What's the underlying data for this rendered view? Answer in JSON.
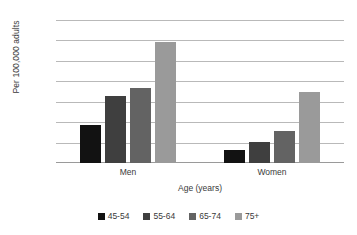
{
  "chart_data": {
    "type": "bar",
    "title": "",
    "xlabel": "Age (years)",
    "ylabel": "Per 100,000 adults",
    "categories": [
      "Men",
      "Women"
    ],
    "series": [
      {
        "name": "45-54",
        "color": "#121212",
        "values": [
          185,
          64
        ]
      },
      {
        "name": "55-64",
        "color": "#3f3f3f",
        "values": [
          328,
          103
        ]
      },
      {
        "name": "65-74",
        "color": "#636363",
        "values": [
          367,
          157
        ]
      },
      {
        "name": "75+",
        "color": "#9a9a9a",
        "values": [
          592,
          347
        ]
      }
    ],
    "ylim": [
      0,
      700
    ],
    "yticks": [
      0,
      100,
      200,
      300,
      400,
      500,
      600,
      700
    ],
    "ytick_labels": [
      "0",
      "100",
      "200",
      "300",
      "400",
      "500",
      "600",
      "700"
    ],
    "grid": true,
    "legend_position": "bottom"
  }
}
